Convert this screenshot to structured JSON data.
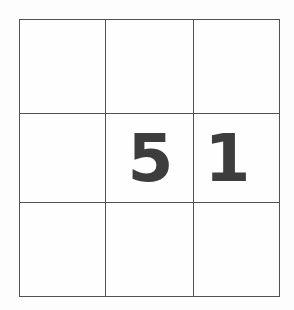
{
  "figure": {
    "name": "3x3-number-grid",
    "background_color": "#fdfdfd",
    "line_color": "#4f5153",
    "digit_color": "#3d3d3d",
    "rows": 3,
    "columns": 3
  },
  "grid": {
    "cells": [
      [
        {
          "value": "",
          "row": 0,
          "col": 0,
          "filled": false
        },
        {
          "value": "",
          "row": 0,
          "col": 1,
          "filled": false
        },
        {
          "value": "",
          "row": 0,
          "col": 2,
          "filled": false
        }
      ],
      [
        {
          "value": "",
          "row": 1,
          "col": 0,
          "filled": false
        },
        {
          "value": "5",
          "row": 1,
          "col": 1,
          "filled": true
        },
        {
          "value": "1",
          "row": 1,
          "col": 2,
          "filled": true
        }
      ],
      [
        {
          "value": "",
          "row": 2,
          "col": 0,
          "filled": false
        },
        {
          "value": "",
          "row": 2,
          "col": 1,
          "filled": false
        },
        {
          "value": "",
          "row": 2,
          "col": 2,
          "filled": false
        }
      ]
    ]
  }
}
